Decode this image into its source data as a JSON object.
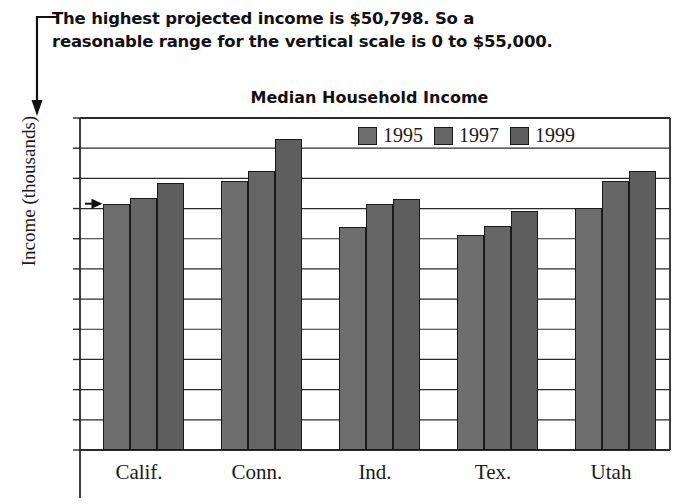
{
  "callout": {
    "text": "The highest projected income is $50,798. So a\nreasonable range for the vertical scale is 0 to $55,000.",
    "leader_icon": "down-arrow-leader-line"
  },
  "chart_data": {
    "type": "bar",
    "title": "Median Household Income",
    "xlabel": "",
    "ylabel": "Income (thousands)",
    "ylim": [
      0,
      55
    ],
    "ytick_step": 5,
    "yticks": [
      55,
      50,
      45,
      40,
      35,
      30,
      25,
      20,
      15,
      10,
      5,
      0
    ],
    "grid": true,
    "legend_position": "top-right-inside",
    "categories": [
      "Calif.",
      "Conn.",
      "Ind.",
      "Tex.",
      "Utah"
    ],
    "series": [
      {
        "name": "1995",
        "color": "#6e6e6e",
        "values": [
          40.8,
          44.5,
          37.0,
          35.7,
          40.1
        ]
      },
      {
        "name": "1997",
        "color": "#666666",
        "values": [
          41.7,
          46.3,
          40.8,
          37.1,
          44.5
        ]
      },
      {
        "name": "1999",
        "color": "#5e5e5e",
        "values": [
          44.3,
          51.5,
          41.6,
          39.6,
          46.2
        ]
      }
    ],
    "annotations": [
      {
        "name": "value-pointer-arrow",
        "target_series": "1995",
        "target_category": "Calif.",
        "value": 40.8
      }
    ]
  }
}
